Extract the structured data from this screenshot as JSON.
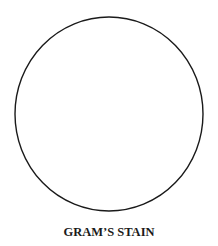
{
  "figure": {
    "caption": "GRAM’S STAIN",
    "circle": {
      "cx": 109,
      "cy": 114,
      "rx": 94,
      "ry": 97,
      "stroke": "#1a1a1a",
      "stroke_width": 1.4,
      "fill": "#ffffff"
    }
  }
}
